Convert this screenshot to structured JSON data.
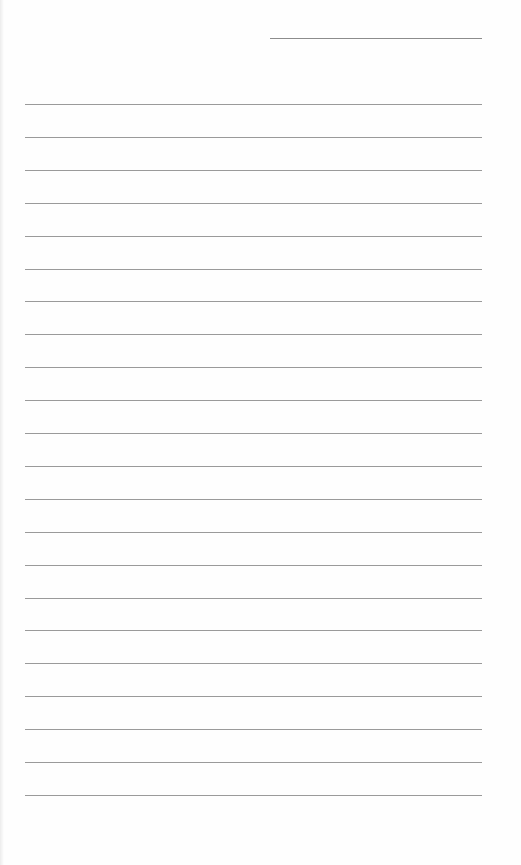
{
  "document": {
    "type": "lined-paper",
    "background_color": "#fefefe",
    "line_color": "#9a9a9a",
    "header_line": {
      "label": ""
    },
    "ruled_lines": [
      {
        "text": ""
      },
      {
        "text": ""
      },
      {
        "text": ""
      },
      {
        "text": ""
      },
      {
        "text": ""
      },
      {
        "text": ""
      },
      {
        "text": ""
      },
      {
        "text": ""
      },
      {
        "text": ""
      },
      {
        "text": ""
      },
      {
        "text": ""
      },
      {
        "text": ""
      },
      {
        "text": ""
      },
      {
        "text": ""
      },
      {
        "text": ""
      },
      {
        "text": ""
      },
      {
        "text": ""
      },
      {
        "text": ""
      },
      {
        "text": ""
      },
      {
        "text": ""
      },
      {
        "text": ""
      },
      {
        "text": ""
      }
    ]
  }
}
